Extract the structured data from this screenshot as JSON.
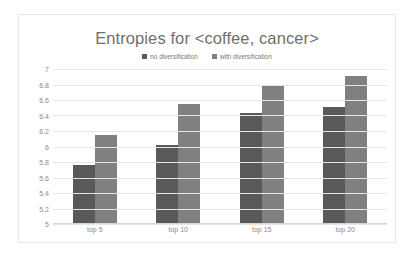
{
  "chart_data": {
    "type": "bar",
    "title": "Entropies for <coffee, cancer>",
    "xlabel": "",
    "ylabel": "",
    "categories": [
      "top 5",
      "top 10",
      "top 15",
      "top 20"
    ],
    "series": [
      {
        "name": "no diversification",
        "color": "#595959",
        "values": [
          5.76,
          6.02,
          6.43,
          6.51
        ]
      },
      {
        "name": "with diversification",
        "color": "#808080",
        "values": [
          6.15,
          6.55,
          6.79,
          6.91
        ]
      }
    ],
    "ylim": [
      5,
      7
    ],
    "ytick_step": 0.2,
    "ytick_labels": [
      "7",
      "6.8",
      "6.6",
      "6.4",
      "6.2",
      "6",
      "5.8",
      "5.6",
      "5.4",
      "5.2",
      "5"
    ],
    "grid": true,
    "legend_position": "top"
  },
  "style": {
    "title_color": "#6f6f6f",
    "tick_color": "#8a8a8a",
    "gridline_color": "#e6e6e6",
    "frame_color": "#e8e8e8",
    "plot_background": "#ffffff"
  }
}
